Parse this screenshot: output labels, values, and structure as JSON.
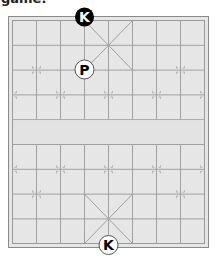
{
  "caption": "game.",
  "board": {
    "background": "#e6e6e6",
    "line_color": "#9a9a9a",
    "border_color": "#8a8a8a",
    "files": 9,
    "ranks": 10,
    "river_label": ""
  },
  "pieces": [
    {
      "id": "black-king",
      "label": "K",
      "side": "black",
      "file": 4,
      "rank": 0
    },
    {
      "id": "white-pawn",
      "label": "P",
      "side": "white",
      "file": 3,
      "rank": 2
    },
    {
      "id": "white-king",
      "label": "K",
      "side": "white",
      "file": 4,
      "rank": 9
    }
  ]
}
